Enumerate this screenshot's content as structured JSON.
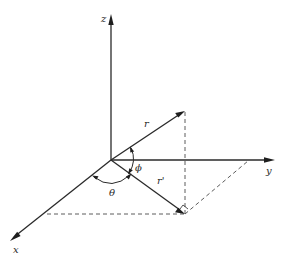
{
  "diagram": {
    "type": "spherical-coordinates-3d-axes",
    "axes": {
      "x": {
        "label": "x"
      },
      "y": {
        "label": "y"
      },
      "z": {
        "label": "z"
      }
    },
    "vectors": {
      "r": {
        "label": "r"
      },
      "r_prime": {
        "label": "r'"
      }
    },
    "angles": {
      "theta": {
        "label": "θ",
        "between": [
          "x-axis",
          "r'"
        ]
      },
      "phi": {
        "label": "ϕ",
        "between": [
          "r",
          "r'"
        ]
      }
    },
    "projections": [
      "r tip to r' tip (vertical, dashed)",
      "r' tip to x-axis (dashed)",
      "r' tip to y-axis (dashed)"
    ],
    "right_angle_marker": "at r' tip"
  }
}
